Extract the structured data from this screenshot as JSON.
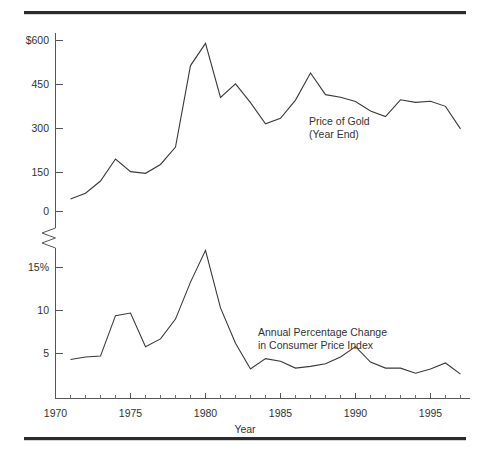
{
  "chart_data": {
    "type": "line",
    "title": "",
    "xlabel": "Year",
    "ylabel": "",
    "grid": false,
    "legend_position": "inline-annotation",
    "panels": [
      {
        "name": "gold-panel",
        "annotation_line1": "Price of Gold",
        "annotation_line2": "(Year End)",
        "ylabel": "",
        "ytick_labels": [
          "$600",
          "450",
          "300",
          "150",
          "0"
        ],
        "ytick_values": [
          600,
          450,
          300,
          150,
          0
        ],
        "ylim": [
          0,
          660
        ],
        "x": [
          1971,
          1972,
          1973,
          1974,
          1975,
          1976,
          1977,
          1978,
          1979,
          1980,
          1981,
          1982,
          1983,
          1984,
          1985,
          1986,
          1987,
          1988,
          1989,
          1990,
          1991,
          1992,
          1993,
          1994,
          1995,
          1996,
          1997
        ],
        "values": [
          44,
          64,
          107,
          184,
          140,
          134,
          165,
          226,
          512,
          590,
          400,
          448,
          382,
          308,
          327,
          391,
          486,
          410,
          401,
          386,
          353,
          333,
          392,
          383,
          387,
          369,
          290
        ]
      },
      {
        "name": "cpi-panel",
        "annotation_line1": "Annual Percentage Change",
        "annotation_line2": "in Consumer Price Index",
        "ylabel": "",
        "ytick_labels": [
          "15%",
          "10",
          "5"
        ],
        "ytick_values": [
          15,
          10,
          5
        ],
        "ylim": [
          0.6,
          18
        ],
        "x": [
          1971,
          1972,
          1973,
          1974,
          1975,
          1976,
          1977,
          1978,
          1979,
          1980,
          1981,
          1982,
          1983,
          1984,
          1985,
          1986,
          1987,
          1988,
          1989,
          1990,
          1991,
          1992,
          1993,
          1994,
          1995,
          1996,
          1997
        ],
        "values": [
          4.3,
          4.6,
          4.7,
          9.4,
          9.7,
          5.8,
          6.7,
          9.0,
          13.3,
          17.0,
          10.3,
          6.2,
          3.2,
          4.4,
          4.1,
          3.3,
          3.5,
          3.8,
          4.6,
          5.8,
          4.0,
          3.3,
          3.3,
          2.7,
          3.2,
          3.9,
          2.6
        ]
      }
    ],
    "xtick_labels": [
      "1970",
      "1975",
      "1980",
      "1985",
      "1990",
      "1995"
    ],
    "xtick_values": [
      1970,
      1975,
      1980,
      1985,
      1990,
      1995
    ],
    "xlim": [
      1969.3,
      1997.6
    ],
    "axis_break": true,
    "colors": {
      "line": "#3a3a3a",
      "axis": "#555555",
      "text": "#333333",
      "rule": "#2b2b2b",
      "background": "#ffffff"
    }
  },
  "labels": {
    "x_axis_title": "Year"
  }
}
